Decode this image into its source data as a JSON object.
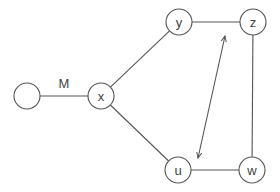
{
  "diagram": {
    "type": "graph",
    "colors": {
      "stroke": "#555555",
      "text": "#444444",
      "background": "#ffffff"
    },
    "nodes": [
      {
        "id": "n0",
        "label": "",
        "x": 27,
        "y": 96
      },
      {
        "id": "x",
        "label": "x",
        "x": 101,
        "y": 96
      },
      {
        "id": "y",
        "label": "y",
        "x": 179,
        "y": 22
      },
      {
        "id": "z",
        "label": "z",
        "x": 253,
        "y": 22
      },
      {
        "id": "u",
        "label": "u",
        "x": 178,
        "y": 170
      },
      {
        "id": "w",
        "label": "w",
        "x": 252,
        "y": 170
      }
    ],
    "node_radius": 13,
    "edges": [
      {
        "from": "n0",
        "to": "x",
        "label": "M"
      },
      {
        "from": "x",
        "to": "y",
        "label": ""
      },
      {
        "from": "x",
        "to": "u",
        "label": ""
      },
      {
        "from": "y",
        "to": "z",
        "label": ""
      },
      {
        "from": "z",
        "to": "w",
        "label": ""
      },
      {
        "from": "u",
        "to": "w",
        "label": ""
      }
    ],
    "arrows": [
      {
        "type": "double-headed",
        "from": [
          225,
          36
        ],
        "to": [
          198,
          158
        ]
      }
    ],
    "edge_label_M": "M"
  }
}
